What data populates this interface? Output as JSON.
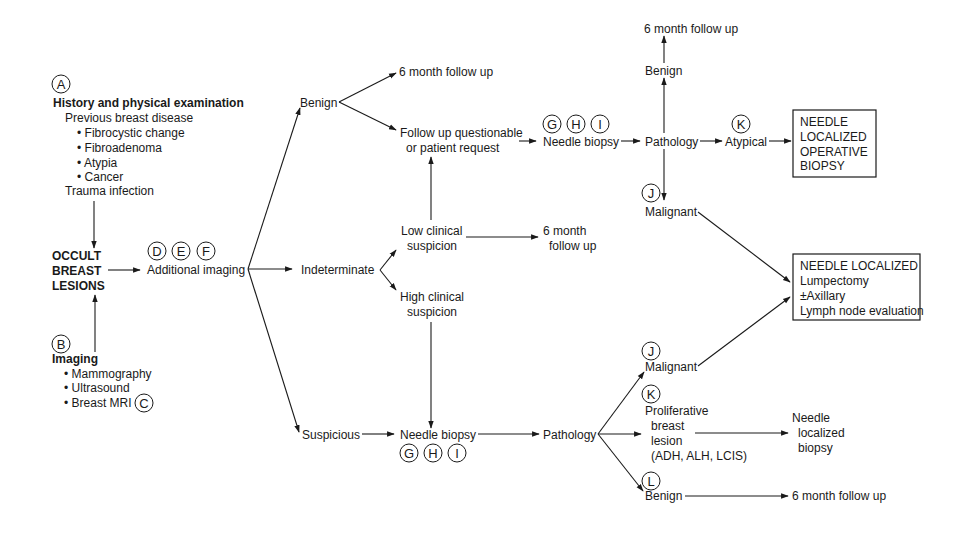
{
  "diagram": {
    "type": "flowchart",
    "topic": "Occult breast lesions workup",
    "history": {
      "marker": "A",
      "title": "History and physical examination",
      "subtitle": "Previous breast disease",
      "items": [
        "Fibrocystic change",
        "Fibroadenoma",
        "Atypia",
        "Cancer"
      ],
      "extra": "Trauma infection"
    },
    "imaging": {
      "marker": "B",
      "title": "Imaging",
      "items": [
        "Mammography",
        "Ultrasound",
        "Breast MRI"
      ],
      "mri_marker": "C"
    },
    "occult": {
      "lines": [
        "OCCULT",
        "BREAST",
        "LESIONS"
      ]
    },
    "additional_imaging": {
      "markers": [
        "D",
        "E",
        "F"
      ],
      "label": "Additional imaging"
    },
    "benign_top": {
      "label": "Benign"
    },
    "follow_up_6mo_top": {
      "label": "6 month follow up"
    },
    "follow_up_questionable": {
      "lines": [
        "Follow up questionable",
        "or patient request"
      ]
    },
    "indeterminate": {
      "label": "Indeterminate"
    },
    "low_suspicion": {
      "lines": [
        "Low clinical",
        "suspicion"
      ]
    },
    "follow_up_6mo_mid": {
      "lines": [
        "6 month",
        "follow up"
      ]
    },
    "high_suspicion": {
      "lines": [
        "High clinical",
        "suspicion"
      ]
    },
    "suspicious": {
      "label": "Suspicious"
    },
    "needle_biopsy_top": {
      "markers": [
        "G",
        "H",
        "I"
      ],
      "label": "Needle biopsy"
    },
    "pathology_top": {
      "label": "Pathology"
    },
    "benign_upper": {
      "label": "Benign"
    },
    "follow_up_6mo_upper": {
      "label": "6 month follow up"
    },
    "atypical": {
      "marker": "K",
      "label": "Atypical"
    },
    "box_operative": {
      "lines": [
        "NEEDLE",
        "LOCALIZED",
        "OPERATIVE",
        "BIOPSY"
      ]
    },
    "malignant_top": {
      "marker": "J",
      "label": "Malignant"
    },
    "box_lumpectomy": {
      "lines": [
        "NEEDLE LOCALIZED",
        "Lumpectomy",
        "±Axillary",
        "Lymph node evaluation"
      ]
    },
    "needle_biopsy_bottom": {
      "markers": [
        "G",
        "H",
        "I"
      ],
      "label": "Needle biopsy"
    },
    "pathology_bottom": {
      "label": "Pathology"
    },
    "malignant_bottom": {
      "marker": "J",
      "label": "Malignant"
    },
    "proliferative": {
      "marker": "K",
      "lines": [
        "Proliferative",
        "breast",
        "lesion",
        "(ADH, ALH, LCIS)"
      ]
    },
    "needle_localized_biopsy": {
      "lines": [
        "Needle",
        "localized",
        "biopsy"
      ]
    },
    "benign_bottom": {
      "marker": "L",
      "label": "Benign"
    },
    "follow_up_6mo_bottom": {
      "label": "6 month follow up"
    }
  }
}
